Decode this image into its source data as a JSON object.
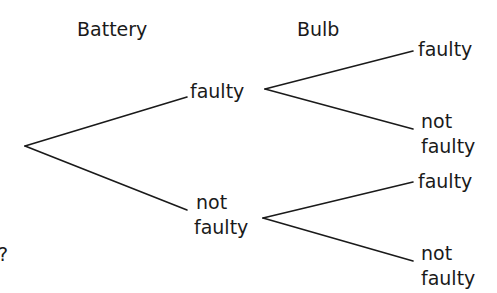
{
  "diagram": {
    "type": "probability-tree",
    "headers": {
      "level1": "Battery",
      "level2": "Bulb"
    },
    "level1_nodes": [
      {
        "label": "faulty"
      },
      {
        "label_line1": "not",
        "label_line2": "faulty"
      }
    ],
    "level2_nodes": [
      {
        "parent": "faulty",
        "label": "faulty"
      },
      {
        "parent": "faulty",
        "label_line1": "not",
        "label_line2": "faulty"
      },
      {
        "parent": "not faulty",
        "label": "faulty"
      },
      {
        "parent": "not faulty",
        "label_line1": "not",
        "label_line2": "faulty"
      }
    ],
    "stray_text": "?",
    "line_color": "#1a1a1a"
  }
}
